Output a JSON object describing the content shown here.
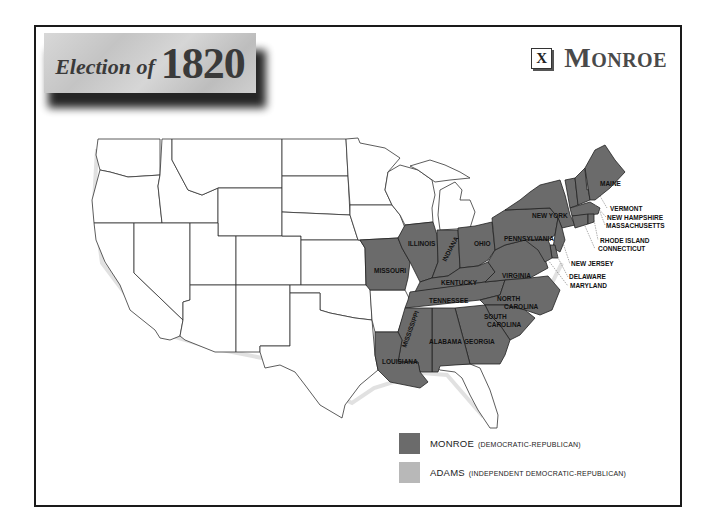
{
  "header": {
    "title_prefix": "Election of",
    "title_year": "1820",
    "winner_mark": "X",
    "winner_name": "Monroe"
  },
  "legend": {
    "items": [
      {
        "candidate": "MONROE",
        "party": "(DEMOCRATIC-REPUBLICAN)",
        "color": "#6b6b6b"
      },
      {
        "candidate": "ADAMS",
        "party": "(INDEPENDENT DEMOCRATIC-REPUBLICAN)",
        "color": "#b8b8b8"
      }
    ]
  },
  "map": {
    "monroe_states": [
      "MAINE",
      "NEW YORK",
      "PENNSYLVANIA",
      "OHIO",
      "INDIANA",
      "ILLINOIS",
      "MISSOURI",
      "KENTUCKY",
      "VIRGINIA",
      "TENNESSEE",
      "NORTH CAROLINA",
      "SOUTH CAROLINA",
      "GEORGIA",
      "ALABAMA",
      "MISSISSIPPI",
      "LOUISIANA",
      "VERMONT",
      "NEW HAMPSHIRE",
      "MASSACHUSETTS",
      "RHODE ISLAND",
      "CONNECTICUT",
      "NEW JERSEY",
      "DELAWARE",
      "MARYLAND"
    ],
    "labels": {
      "maine": "MAINE",
      "new_york": "NEW YORK",
      "pennsylvania": "PENNSYLVANIA",
      "ohio": "OHIO",
      "indiana": "INDIANA",
      "illinois": "ILLINOIS",
      "missouri": "MISSOURI",
      "kentucky": "KENTUCKY",
      "virginia": "VIRGINIA",
      "tennessee": "TENNESSEE",
      "north_carolina_1": "NORTH",
      "north_carolina_2": "CAROLINA",
      "south_carolina_1": "SOUTH",
      "south_carolina_2": "CAROLINA",
      "georgia": "GEORGIA",
      "alabama": "ALABAMA",
      "mississippi": "MISSISSIPPI",
      "louisiana": "LOUISIANA",
      "vermont": "VERMONT",
      "new_hampshire": "NEW HAMPSHIRE",
      "massachusetts": "MASSACHUSETTS",
      "rhode_island": "RHODE ISLAND",
      "connecticut": "CONNECTICUT",
      "new_jersey": "NEW JERSEY",
      "delaware": "DELAWARE",
      "maryland": "MARYLAND"
    }
  }
}
